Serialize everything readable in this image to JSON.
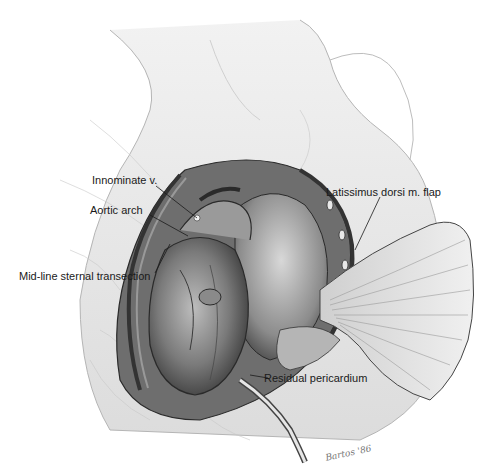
{
  "figure": {
    "type": "surgical illustration",
    "colors": {
      "background": "#ffffff",
      "line": "#1a1a1a",
      "shading": "#8a8a8a",
      "tissue_light": "#e2e2e2",
      "tissue_dark": "#555555"
    }
  },
  "labels": [
    {
      "id": "innominate",
      "text": "Innominate v."
    },
    {
      "id": "aortic_arch",
      "text": "Aortic arch"
    },
    {
      "id": "sternal",
      "text": "Mid-line sternal transection"
    },
    {
      "id": "latissimus",
      "text": "Latissimus dorsi m. flap"
    },
    {
      "id": "pericardium",
      "text": "Residual pericardium"
    }
  ],
  "signature": "Bartos '86"
}
